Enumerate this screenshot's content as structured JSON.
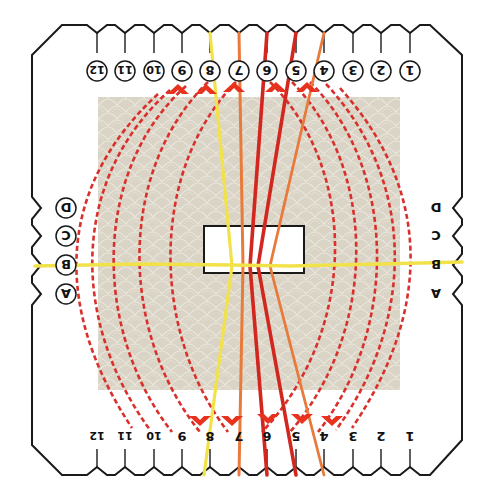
{
  "diagram": {
    "title": "Braiding loom threading diagram",
    "orientation": "upside-down",
    "colors": {
      "board_outline": "#1a1a1a",
      "board_fill": "#ffffff",
      "pattern_panel": "#d9d4c6",
      "pattern_line": "#ece8dd",
      "center_hole": "#ffffff",
      "dash_path": "#d9302b",
      "arrow": "#e8321e",
      "yellow_thread": "#f2e24a",
      "orange_thread": "#e87a3c",
      "red_thread": "#d3261e",
      "dark_red_thread": "#c33a20"
    },
    "top_slots": {
      "labels": [
        "12",
        "11",
        "10",
        "9",
        "8",
        "7",
        "6",
        "5",
        "4",
        "3",
        "2",
        "1"
      ],
      "circled": true,
      "x": [
        97,
        125,
        154,
        182,
        210,
        239,
        267,
        296,
        324,
        353,
        381,
        410
      ]
    },
    "bottom_slots": {
      "labels": [
        "12",
        "11",
        "10",
        "9",
        "8",
        "7",
        "6",
        "5",
        "4",
        "3",
        "2",
        "1"
      ],
      "circled": false,
      "x": [
        97,
        125,
        154,
        182,
        210,
        239,
        267,
        296,
        324,
        353,
        381,
        410
      ]
    },
    "left_slots": {
      "labels": [
        "D",
        "C",
        "B",
        "A"
      ],
      "circled": true,
      "y": [
        208,
        236,
        265,
        294
      ]
    },
    "right_slots": {
      "labels": [
        "D",
        "C",
        "B",
        "A"
      ],
      "circled": false,
      "y": [
        208,
        236,
        265,
        294
      ]
    },
    "threads": [
      {
        "name": "yellow-horizontal",
        "color": "yellow_thread",
        "from": "left B",
        "to": "right B"
      },
      {
        "name": "yellow-vertical",
        "color": "yellow_thread",
        "from": "top 8",
        "to": "bottom 8"
      },
      {
        "name": "orange-7",
        "color": "orange_thread",
        "from": "top 7",
        "to": "bottom 7"
      },
      {
        "name": "red-6",
        "color": "red_thread",
        "from": "top 6",
        "to": "bottom 6"
      },
      {
        "name": "red-5",
        "color": "red_thread",
        "from": "top 5",
        "to": "bottom 5"
      },
      {
        "name": "orange-4",
        "color": "orange_thread",
        "from": "top 4",
        "to": "bottom 4"
      }
    ],
    "moves": [
      {
        "from": "bottom 12 side",
        "to": "top 9",
        "arrow": "up"
      },
      {
        "from": "bottom 11 side",
        "to": "top 8",
        "arrow": "up"
      },
      {
        "from": "bottom 10 side",
        "to": "top 7",
        "arrow": "up"
      },
      {
        "from": "bottom 3 side",
        "to": "top 6",
        "arrow": "up"
      },
      {
        "from": "bottom 2 side",
        "to": "top 5",
        "arrow": "up"
      },
      {
        "from": "top 12 side",
        "to": "bottom 8",
        "arrow": "down"
      },
      {
        "from": "top 11 side",
        "to": "bottom 7",
        "arrow": "down"
      },
      {
        "from": "top 3 side",
        "to": "bottom 6",
        "arrow": "down"
      },
      {
        "from": "top 2 side",
        "to": "bottom 5",
        "arrow": "down"
      },
      {
        "from": "top 1 side",
        "to": "bottom 4",
        "arrow": "down"
      }
    ]
  }
}
